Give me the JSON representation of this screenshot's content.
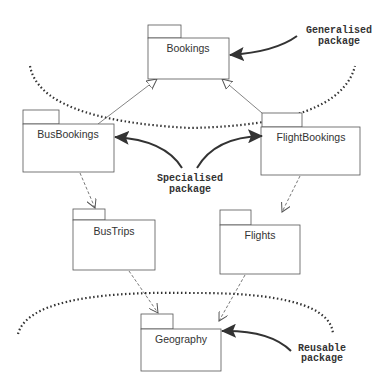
{
  "diagram": {
    "type": "UML package diagram",
    "packages": [
      {
        "id": "bookings",
        "label": "Bookings"
      },
      {
        "id": "busbookings",
        "label": "BusBookings"
      },
      {
        "id": "flightbookings",
        "label": "FlightBookings"
      },
      {
        "id": "bustrips",
        "label": "BusTrips"
      },
      {
        "id": "flights",
        "label": "Flights"
      },
      {
        "id": "geography",
        "label": "Geography"
      }
    ],
    "relationships": [
      {
        "from": "BusBookings",
        "to": "Bookings",
        "kind": "generalization"
      },
      {
        "from": "FlightBookings",
        "to": "Bookings",
        "kind": "generalization"
      },
      {
        "from": "BusBookings",
        "to": "BusTrips",
        "kind": "dependency"
      },
      {
        "from": "FlightBookings",
        "to": "Flights",
        "kind": "dependency"
      },
      {
        "from": "BusTrips",
        "to": "Geography",
        "kind": "dependency"
      },
      {
        "from": "Flights",
        "to": "Geography",
        "kind": "dependency"
      }
    ],
    "annotations": {
      "generalised": {
        "line1": "Generalised",
        "line2": "package"
      },
      "specialised": {
        "line1": "Specialised",
        "line2": "package"
      },
      "reusable": {
        "line1": "Reusable",
        "line2": "package"
      }
    },
    "colors": {
      "box_stroke": "#555555",
      "text": "#333333",
      "arrow_fill": "#333333"
    }
  }
}
